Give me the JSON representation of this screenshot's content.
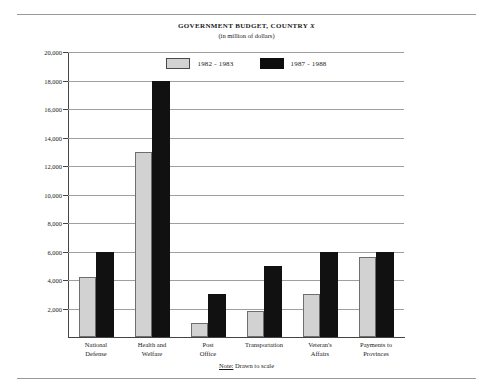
{
  "figure": {
    "title_main": "GOVERNMENT BUDGET, COUNTRY ",
    "title_italic": "X",
    "subtitle": "(in million of dollars)",
    "note_label": "Note:",
    "note_text": " Drawn to scale"
  },
  "legend": {
    "items": [
      {
        "label": "1982 - 1983",
        "color": "#d2d2d2",
        "style": "light"
      },
      {
        "label": "1987 - 1988",
        "color": "#111111",
        "style": "dark"
      }
    ]
  },
  "axis": {
    "y_ticks": [
      "20,000",
      "18,000",
      "16,000",
      "14,000",
      "12,000",
      "10,000",
      "8,000",
      "6,000",
      "4,000",
      "2,000"
    ],
    "y_tick_values": [
      20000,
      18000,
      16000,
      14000,
      12000,
      10000,
      8000,
      6000,
      4000,
      2000
    ],
    "x_categories": [
      [
        "National",
        "Defense"
      ],
      [
        "Health and",
        "Welfare"
      ],
      [
        "Post",
        "Office"
      ],
      [
        "Transportation",
        ""
      ],
      [
        "Veteran's",
        "Affairs"
      ],
      [
        "Payments to",
        "Provinces"
      ]
    ]
  },
  "chart_data": {
    "type": "bar",
    "title": "GOVERNMENT BUDGET, COUNTRY X",
    "subtitle": "(in million of dollars)",
    "xlabel": "",
    "ylabel": "in million of dollars",
    "ylim": [
      0,
      20000
    ],
    "ytick_step": 2000,
    "grid": true,
    "legend_position": "top-center",
    "annotation": "Note: Drawn to scale",
    "categories": [
      "National Defense",
      "Health and Welfare",
      "Post Office",
      "Transportation",
      "Veteran's Affairs",
      "Payments to Provinces"
    ],
    "series": [
      {
        "name": "1982 - 1983",
        "color": "#d2d2d2",
        "values": [
          4200,
          13000,
          1000,
          1800,
          3000,
          5600
        ]
      },
      {
        "name": "1987 - 1988",
        "color": "#111111",
        "values": [
          6000,
          18000,
          3000,
          5000,
          6000,
          6000
        ]
      }
    ]
  }
}
